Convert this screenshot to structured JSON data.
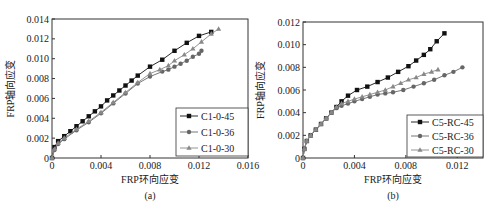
{
  "chart_data": [
    {
      "type": "line",
      "panel_label": "(a)",
      "xlabel": "FRP环向应变",
      "ylabel": "FRP轴向应变",
      "xlim": [
        0,
        0.016
      ],
      "ylim": [
        0,
        0.014
      ],
      "xticks": [
        "0",
        "0.004",
        "0.008",
        "0.012",
        "0.016"
      ],
      "yticks": [
        "0",
        "0.002",
        "0.004",
        "0.006",
        "0.008",
        "0.010",
        "0.012",
        "0.014"
      ],
      "grid": false,
      "legend_position": "lower right",
      "series": [
        {
          "name": "C1-0-45",
          "marker": "square",
          "color": "#111111",
          "x": [
            0,
            0.0002,
            0.0005,
            0.001,
            0.0015,
            0.002,
            0.0025,
            0.003,
            0.0035,
            0.004,
            0.0045,
            0.005,
            0.0055,
            0.006,
            0.0065,
            0.007,
            0.008,
            0.009,
            0.01,
            0.011,
            0.012,
            0.013
          ],
          "y": [
            0,
            0.0011,
            0.0017,
            0.0022,
            0.0027,
            0.0032,
            0.0037,
            0.0042,
            0.0047,
            0.0052,
            0.0058,
            0.0063,
            0.0068,
            0.0073,
            0.0078,
            0.0083,
            0.0092,
            0.0099,
            0.0108,
            0.0116,
            0.0123,
            0.0127
          ]
        },
        {
          "name": "C1-0-36",
          "marker": "circle",
          "color": "#666666",
          "x": [
            0,
            0.0002,
            0.0005,
            0.001,
            0.002,
            0.003,
            0.004,
            0.005,
            0.006,
            0.007,
            0.008,
            0.009,
            0.0095,
            0.01,
            0.0105,
            0.011,
            0.0115,
            0.012,
            0.0122
          ],
          "y": [
            0,
            0.0008,
            0.0014,
            0.0019,
            0.0028,
            0.0036,
            0.0045,
            0.0055,
            0.0065,
            0.0075,
            0.0082,
            0.0087,
            0.0089,
            0.0092,
            0.0095,
            0.0098,
            0.0102,
            0.0105,
            0.0108
          ]
        },
        {
          "name": "C1-0-30",
          "marker": "triangle",
          "color": "#888888",
          "x": [
            0,
            0.0002,
            0.0005,
            0.001,
            0.002,
            0.003,
            0.004,
            0.005,
            0.006,
            0.007,
            0.008,
            0.0088,
            0.0095,
            0.01,
            0.0108,
            0.0115,
            0.0122,
            0.013,
            0.0136
          ],
          "y": [
            0,
            0.0009,
            0.0015,
            0.002,
            0.0029,
            0.0037,
            0.0046,
            0.0056,
            0.0066,
            0.0076,
            0.0085,
            0.0089,
            0.0093,
            0.0098,
            0.0104,
            0.011,
            0.0117,
            0.0125,
            0.013
          ]
        }
      ]
    },
    {
      "type": "line",
      "panel_label": "(b)",
      "xlabel": "FRP环向应变",
      "ylabel": "FRP轴向应变",
      "xlim": [
        0,
        0.014
      ],
      "ylim": [
        0,
        0.012
      ],
      "xticks": [
        "0",
        "0.004",
        "0.008",
        "0.012"
      ],
      "yticks": [
        "0",
        "0.002",
        "0.004",
        "0.006",
        "0.008",
        "0.010",
        "0.012"
      ],
      "grid": false,
      "legend_position": "lower right",
      "series": [
        {
          "name": "C5-RC-45",
          "marker": "square",
          "color": "#111111",
          "x": [
            0,
            0.0001,
            0.0003,
            0.0006,
            0.001,
            0.0014,
            0.0018,
            0.0022,
            0.0026,
            0.003,
            0.0035,
            0.0042,
            0.005,
            0.0058,
            0.0066,
            0.0074,
            0.0082,
            0.0088,
            0.0094,
            0.0099,
            0.0104,
            0.011
          ],
          "y": [
            0,
            0.0008,
            0.0015,
            0.002,
            0.0025,
            0.003,
            0.0035,
            0.004,
            0.0045,
            0.005,
            0.0055,
            0.006,
            0.0063,
            0.0067,
            0.0071,
            0.0076,
            0.0081,
            0.0086,
            0.0091,
            0.0096,
            0.0103,
            0.011
          ]
        },
        {
          "name": "C5-RC-36",
          "marker": "circle",
          "color": "#666666",
          "x": [
            0,
            0.0001,
            0.0003,
            0.0006,
            0.001,
            0.0014,
            0.0018,
            0.0022,
            0.0026,
            0.003,
            0.0035,
            0.004,
            0.0046,
            0.0052,
            0.0058,
            0.0064,
            0.007,
            0.0078,
            0.0086,
            0.0094,
            0.0102,
            0.011,
            0.0117,
            0.0124
          ],
          "y": [
            0,
            0.0008,
            0.0015,
            0.002,
            0.0025,
            0.003,
            0.0035,
            0.004,
            0.0044,
            0.0046,
            0.0048,
            0.005,
            0.0052,
            0.0054,
            0.0056,
            0.0057,
            0.0058,
            0.006,
            0.0063,
            0.0066,
            0.0069,
            0.0073,
            0.0076,
            0.008
          ]
        },
        {
          "name": "C5-RC-30",
          "marker": "triangle",
          "color": "#888888",
          "x": [
            0,
            0.0001,
            0.0003,
            0.0006,
            0.001,
            0.0014,
            0.0018,
            0.0022,
            0.0026,
            0.003,
            0.0035,
            0.004,
            0.0046,
            0.0052,
            0.0058,
            0.0064,
            0.007,
            0.0076,
            0.0082,
            0.0088,
            0.0094,
            0.01,
            0.0105
          ],
          "y": [
            0,
            0.0008,
            0.0015,
            0.002,
            0.0025,
            0.003,
            0.0035,
            0.004,
            0.0045,
            0.0048,
            0.005,
            0.0052,
            0.0054,
            0.0056,
            0.0058,
            0.006,
            0.0063,
            0.0066,
            0.0069,
            0.0071,
            0.0074,
            0.0076,
            0.0078
          ]
        }
      ]
    }
  ]
}
